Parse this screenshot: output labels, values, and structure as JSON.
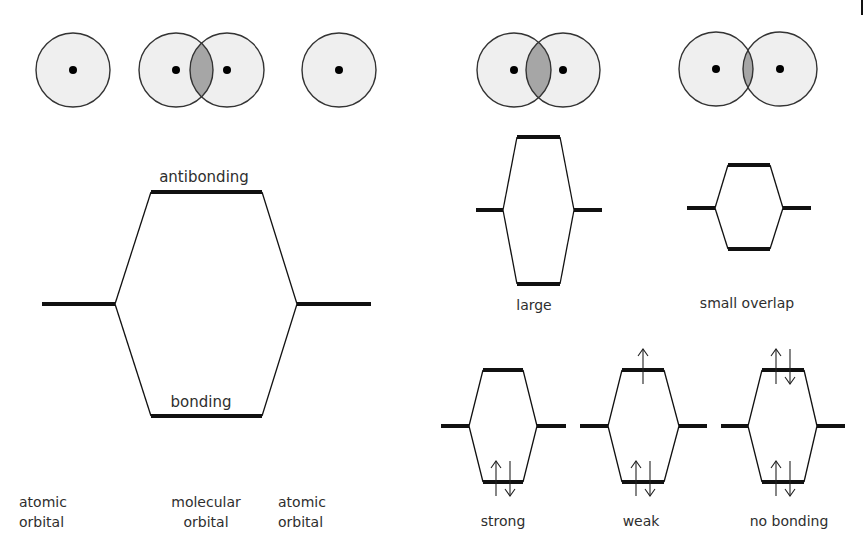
{
  "colors": {
    "stroke": "#111111",
    "circle_fill": "#efefef",
    "circle_stroke": "#333333",
    "overlap_fill": "#a6a6a6",
    "text": "#2e2e2e"
  },
  "main_diagram": {
    "labels": {
      "antibonding": "antibonding",
      "bonding": "bonding",
      "left_axis": [
        "atomic",
        "orbital"
      ],
      "center_axis": [
        "molecular",
        "orbital"
      ],
      "right_axis": [
        "atomic",
        "orbital"
      ]
    },
    "atoms": [
      {
        "cx": 73,
        "cy": 70,
        "r": 37
      },
      {
        "pair": true,
        "c1": 176,
        "c2": 227,
        "cy": 70,
        "r": 37
      },
      {
        "cx": 339,
        "cy": 70,
        "r": 37
      }
    ],
    "levels": {
      "left_ao": {
        "x1": 42,
        "x2": 115,
        "y": 304
      },
      "antibonding": {
        "x1": 151,
        "x2": 262,
        "y": 192
      },
      "bonding": {
        "x1": 151,
        "x2": 262,
        "y": 416
      },
      "right_ao": {
        "x1": 297,
        "x2": 371,
        "y": 304
      }
    }
  },
  "overlap_examples": [
    {
      "label": "large",
      "c1": 514,
      "c2": 563,
      "cy": 70,
      "r": 37,
      "ao_left": [
        476,
        503,
        210
      ],
      "mo_top": [
        517,
        560,
        137
      ],
      "mo_bottom": [
        517,
        560,
        284
      ],
      "ao_right": [
        574,
        602,
        210
      ],
      "label_x": 534,
      "label_y": 295
    },
    {
      "label": "small overlap",
      "c1": 716,
      "c2": 780,
      "cy": 69,
      "r": 37,
      "ao_left": [
        687,
        715,
        208
      ],
      "mo_top": [
        728,
        770,
        165
      ],
      "mo_bottom": [
        728,
        770,
        249
      ],
      "ao_right": [
        783,
        811,
        208
      ],
      "label_x": 747,
      "label_y": 293
    }
  ],
  "filling_examples": [
    {
      "label": "strong",
      "ao_left": [
        441,
        469,
        426
      ],
      "mo_top": [
        483,
        523,
        370
      ],
      "mo_bottom": [
        483,
        523,
        482
      ],
      "ao_right": [
        537,
        566,
        426
      ],
      "top_electrons": [],
      "bottom_electrons": [
        "up",
        "down"
      ],
      "label_x": 503
    },
    {
      "label": "weak",
      "ao_left": [
        580,
        608,
        426
      ],
      "mo_top": [
        622,
        664,
        370
      ],
      "mo_bottom": [
        622,
        664,
        482
      ],
      "ao_right": [
        679,
        707,
        426
      ],
      "top_electrons": [
        "up"
      ],
      "bottom_electrons": [
        "up",
        "down"
      ],
      "label_x": 641
    },
    {
      "label": "no bonding",
      "ao_left": [
        721,
        748,
        426
      ],
      "mo_top": [
        762,
        804,
        370
      ],
      "mo_bottom": [
        762,
        804,
        482
      ],
      "ao_right": [
        817,
        845,
        426
      ],
      "top_electrons": [
        "up",
        "down"
      ],
      "bottom_electrons": [
        "up",
        "down"
      ],
      "label_x": 789
    }
  ]
}
